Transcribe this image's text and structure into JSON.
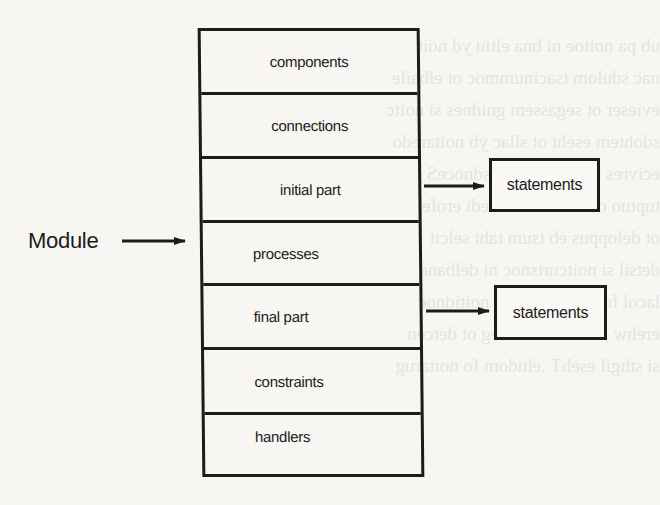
{
  "diagram": {
    "type": "module-structure",
    "module_label": "Module",
    "sections": [
      {
        "label": "components",
        "align": "center"
      },
      {
        "label": "connections",
        "align": "center"
      },
      {
        "label": "initial part",
        "align": "center"
      },
      {
        "label": "processes",
        "align": "left"
      },
      {
        "label": "final part",
        "align": "left"
      },
      {
        "label": "constraints",
        "align": "left"
      },
      {
        "label": "handlers",
        "align": "left"
      }
    ],
    "outputs": [
      {
        "from": "initial part",
        "label": "statements"
      },
      {
        "from": "final part",
        "label": "statements"
      }
    ],
    "edges": [
      {
        "from": "Module",
        "to": "processes",
        "type": "arrow"
      },
      {
        "from": "initial part",
        "to": "statements",
        "type": "arrow"
      },
      {
        "from": "final part",
        "to": "statements",
        "type": "arrow"
      }
    ],
    "colors": {
      "ink": "#1c1c1c",
      "paper": "#f7f6f3"
    }
  }
}
